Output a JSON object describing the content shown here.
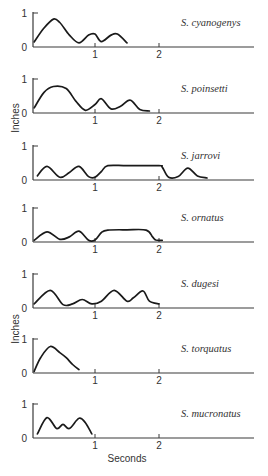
{
  "chart_data": {
    "type": "line",
    "title": "",
    "xlabel": "Seconds",
    "ylabel": "Inches",
    "xlim": [
      0,
      3.5
    ],
    "ylim": [
      0,
      1
    ],
    "x_ticks": [
      "1",
      "2"
    ],
    "y_ticks": [
      "0",
      "1"
    ],
    "grid": false,
    "legend": "none",
    "series": [
      {
        "name": "S. cyanogenys",
        "x": [
          0.05,
          0.2,
          0.35,
          0.45,
          0.6,
          0.75,
          0.9,
          1.0,
          1.1,
          1.25,
          1.35,
          1.5
        ],
        "y": [
          0.15,
          0.55,
          0.82,
          0.72,
          0.35,
          0.12,
          0.35,
          0.38,
          0.16,
          0.35,
          0.38,
          0.12
        ]
      },
      {
        "name": "S. poinsetti",
        "x": [
          0.05,
          0.2,
          0.35,
          0.55,
          0.7,
          0.85,
          1.0,
          1.1,
          1.25,
          1.4,
          1.55,
          1.7,
          1.85
        ],
        "y": [
          0.15,
          0.6,
          0.78,
          0.72,
          0.35,
          0.08,
          0.25,
          0.42,
          0.12,
          0.2,
          0.38,
          0.1,
          0.06
        ]
      },
      {
        "name": "S. jarrovi",
        "x": [
          0.1,
          0.25,
          0.45,
          0.6,
          0.75,
          0.9,
          1.0,
          1.1,
          1.2,
          1.5,
          2.0,
          2.05,
          2.15,
          2.3,
          2.45,
          2.6,
          2.75
        ],
        "y": [
          0.12,
          0.4,
          0.08,
          0.22,
          0.4,
          0.1,
          0.08,
          0.25,
          0.42,
          0.42,
          0.42,
          0.38,
          0.08,
          0.1,
          0.35,
          0.12,
          0.06
        ]
      },
      {
        "name": "S. ornatus",
        "x": [
          0.05,
          0.25,
          0.45,
          0.6,
          0.75,
          0.9,
          1.0,
          1.1,
          1.2,
          1.5,
          1.8,
          1.9,
          1.95,
          2.05
        ],
        "y": [
          0.05,
          0.3,
          0.08,
          0.15,
          0.32,
          0.05,
          0.06,
          0.28,
          0.35,
          0.36,
          0.35,
          0.15,
          0.06,
          0.05
        ]
      },
      {
        "name": "S. dugesi",
        "x": [
          0.05,
          0.3,
          0.5,
          0.65,
          0.8,
          0.95,
          1.1,
          1.3,
          1.5,
          1.6,
          1.75,
          1.85,
          2.0
        ],
        "y": [
          0.12,
          0.52,
          0.1,
          0.12,
          0.25,
          0.12,
          0.2,
          0.52,
          0.2,
          0.3,
          0.5,
          0.2,
          0.12
        ]
      },
      {
        "name": "S. torquatus",
        "x": [
          0.05,
          0.15,
          0.3,
          0.45,
          0.55,
          0.65,
          0.75
        ],
        "y": [
          0.05,
          0.45,
          0.78,
          0.6,
          0.45,
          0.25,
          0.1
        ]
      },
      {
        "name": "S. mucronatus",
        "x": [
          0.1,
          0.25,
          0.4,
          0.5,
          0.6,
          0.75,
          0.85,
          0.95
        ],
        "y": [
          0.12,
          0.6,
          0.28,
          0.4,
          0.28,
          0.58,
          0.45,
          0.12
        ]
      }
    ]
  },
  "figure": {
    "y_axis_label_top": "Inches",
    "y_axis_label_bottom": "Inches",
    "x_axis_label": "Seconds",
    "caption": "Figure 13.10"
  }
}
